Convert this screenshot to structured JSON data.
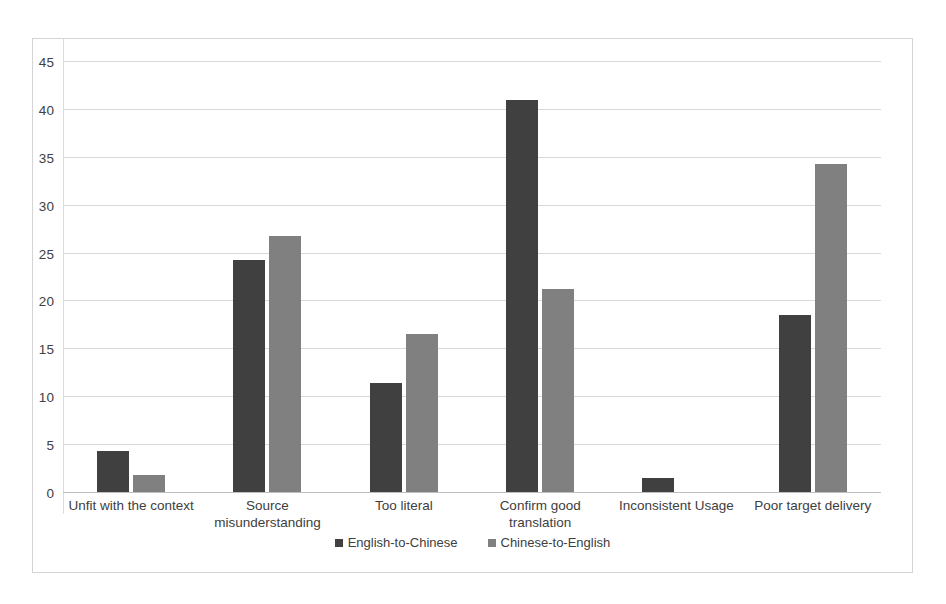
{
  "chart_data": {
    "type": "bar",
    "title": "",
    "subtitle": "",
    "xlabel": "",
    "ylabel": "",
    "ylim": [
      0,
      45
    ],
    "yticks": [
      0,
      5,
      10,
      15,
      20,
      25,
      30,
      35,
      40,
      45
    ],
    "grid": true,
    "legend_position": "bottom",
    "categories": [
      "Unfit with the context",
      "Source misunderstanding",
      "Too literal",
      "Confirm good translation",
      "Inconsistent Usage",
      "Poor target delivery"
    ],
    "series": [
      {
        "name": "English-to-Chinese",
        "color": "#404040",
        "values": [
          4.3,
          24.2,
          11.4,
          40.9,
          1.5,
          18.5
        ]
      },
      {
        "name": "Chinese-to-English",
        "color": "#808080",
        "values": [
          1.8,
          26.7,
          16.5,
          21.2,
          0,
          34.2
        ]
      }
    ]
  },
  "axis": {
    "yticks": [
      "45",
      "40",
      "35",
      "30",
      "25",
      "20",
      "15",
      "10",
      "5",
      "0"
    ]
  },
  "legend": {
    "items": [
      {
        "label": "English-to-Chinese",
        "color": "#404040"
      },
      {
        "label": "Chinese-to-English",
        "color": "#808080"
      }
    ]
  }
}
